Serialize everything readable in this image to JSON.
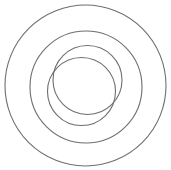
{
  "diagram": {
    "type": "nested-circles",
    "stroke_color": "#6e6e6e",
    "stroke_width": 1.1,
    "background": "#ffffff",
    "circles": [
      {
        "name": "outer-circle",
        "cx": 85.5,
        "cy": 85.5,
        "r": 80.5
      },
      {
        "name": "middle-circle",
        "cx": 86,
        "cy": 87,
        "r": 56
      },
      {
        "name": "inner-circle-upper",
        "cx": 87.5,
        "cy": 80,
        "r": 34.5
      },
      {
        "name": "inner-circle-lower",
        "cx": 81.5,
        "cy": 91.5,
        "r": 34
      }
    ]
  }
}
